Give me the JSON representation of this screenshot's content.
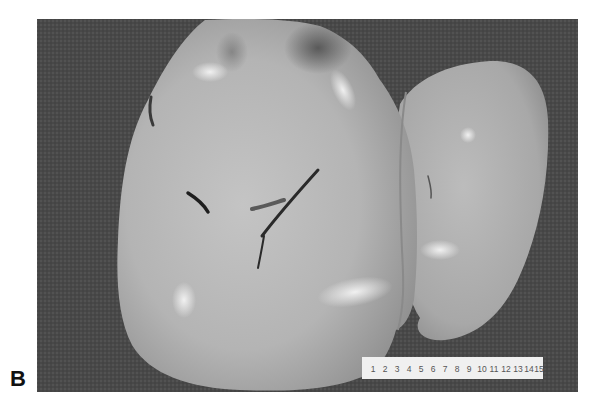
{
  "figure": {
    "panel_label": "B",
    "background_color": "#4a4a4a",
    "page_color": "#ffffff"
  },
  "ruler": {
    "ticks": [
      "1",
      "2",
      "3",
      "4",
      "5",
      "6",
      "7",
      "8",
      "9",
      "10",
      "11",
      "12",
      "13",
      "14",
      "15"
    ],
    "unit": "cm"
  }
}
